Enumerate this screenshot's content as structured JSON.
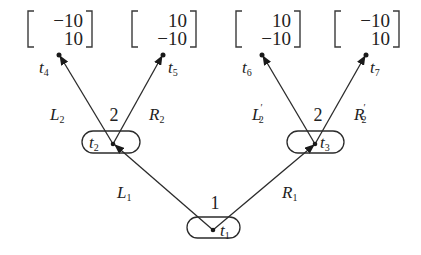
{
  "diagram": {
    "type": "extensive-form game tree",
    "root": {
      "id": "t1",
      "label": "t",
      "sub": "1",
      "player": "1",
      "actions": [
        {
          "label": "L",
          "sub": "1",
          "prime": "",
          "to": "t2"
        },
        {
          "label": "R",
          "sub": "1",
          "prime": "",
          "to": "t3"
        }
      ]
    },
    "nodes": [
      {
        "id": "t2",
        "label": "t",
        "sub": "2",
        "player": "2",
        "actions": [
          {
            "label": "L",
            "sub": "2",
            "prime": "",
            "to": "t4"
          },
          {
            "label": "R",
            "sub": "2",
            "prime": "",
            "to": "t5"
          }
        ]
      },
      {
        "id": "t3",
        "label": "t",
        "sub": "3",
        "player": "2",
        "actions": [
          {
            "label": "L",
            "sub": "2",
            "prime": "′",
            "to": "t6"
          },
          {
            "label": "R",
            "sub": "2",
            "prime": "′",
            "to": "t7"
          }
        ]
      }
    ],
    "leaves": [
      {
        "id": "t4",
        "label": "t",
        "sub": "4",
        "payoff": [
          "−10",
          "10"
        ]
      },
      {
        "id": "t5",
        "label": "t",
        "sub": "5",
        "payoff": [
          "10",
          "−10"
        ]
      },
      {
        "id": "t6",
        "label": "t",
        "sub": "6",
        "payoff": [
          "10",
          "−10"
        ]
      },
      {
        "id": "t7",
        "label": "t",
        "sub": "7",
        "payoff": [
          "−10",
          "10"
        ]
      }
    ]
  }
}
